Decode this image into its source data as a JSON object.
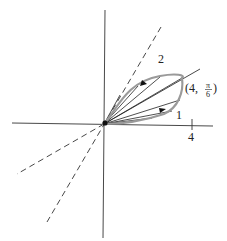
{
  "diagram": {
    "labels": {
      "region_2": "2",
      "region_1": "1",
      "tick_4": "4",
      "point_label_prefix": "(4,",
      "point_label_num": "π",
      "point_label_den": "6",
      "point_label_suffix": ")"
    },
    "colors": {
      "axes": "#333333",
      "curve": "#9a9a9a",
      "rays": "#222222",
      "dashed": "#333333"
    }
  }
}
